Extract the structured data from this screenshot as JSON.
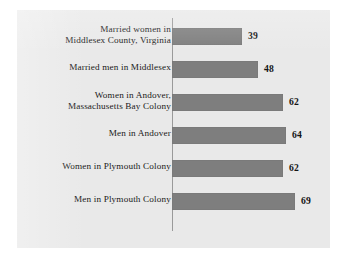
{
  "chart_data": {
    "type": "bar",
    "orientation": "horizontal",
    "title": "",
    "xlabel": "",
    "ylabel": "",
    "grid": false,
    "legend": false,
    "xlim": [
      0,
      75
    ],
    "categories": [
      "Married women in\nMiddlesex County, Virginia",
      "Married men in Middlesex",
      "Women in Andover,\nMassachusetts Bay Colony",
      "Men in Andover",
      "Women in Plymouth Colony",
      "Men in Plymouth Colony"
    ],
    "values": [
      39,
      48,
      62,
      64,
      62,
      69
    ],
    "value_labels": [
      "39",
      "48",
      "62",
      "64",
      "62",
      "69"
    ],
    "bar_color": "#7e7e7e",
    "panel_color": "#e9e9e9",
    "page_color": "#ffffff",
    "axis_color": "#9a9a9a",
    "text_color": "#1a1a1a"
  },
  "rows": [
    {
      "label_line1": "Married women in",
      "label_line2": "Middlesex County, Virginia",
      "value": "39"
    },
    {
      "label_line1": "Married men in Middlesex",
      "label_line2": "",
      "value": "48"
    },
    {
      "label_line1": "Women in Andover,",
      "label_line2": "Massachusetts Bay Colony",
      "value": "62"
    },
    {
      "label_line1": "Men in Andover",
      "label_line2": "",
      "value": "64"
    },
    {
      "label_line1": "Women in Plymouth Colony",
      "label_line2": "",
      "value": "62"
    },
    {
      "label_line1": "Men in Plymouth Colony",
      "label_line2": "",
      "value": "69"
    }
  ]
}
